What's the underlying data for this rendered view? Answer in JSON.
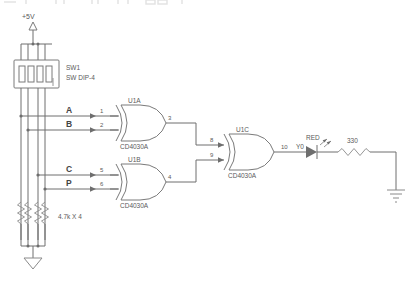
{
  "document": {
    "kind": "circuit-schematic",
    "title": "XOR comparator with DIP switch inputs and RED LED indicator",
    "background_color": "#ffffff",
    "line_color": "#6e6e6e",
    "text_color": "#5a5a5a"
  },
  "toolbar": {
    "visible_fragment": true,
    "note": "faint cropped application toolbar icons along the very top edge"
  },
  "power": {
    "rail_label": "+5V",
    "symbol": "up-arrow"
  },
  "switch": {
    "reference": "SW1",
    "value": "SW DIP-4",
    "poles": 4
  },
  "pulldowns": {
    "value": "4.7k X 4",
    "count": 4,
    "symbol": "zigzag-resistor"
  },
  "signals": [
    {
      "name": "A"
    },
    {
      "name": "B"
    },
    {
      "name": "C"
    },
    {
      "name": "P"
    }
  ],
  "gates": [
    {
      "reference": "U1A",
      "part": "CD4030A",
      "type": "xor",
      "inputs": [
        "1",
        "2"
      ],
      "input_signals": [
        "A",
        "B"
      ],
      "output": "3"
    },
    {
      "reference": "U1B",
      "part": "CD4030A",
      "type": "xor",
      "inputs": [
        "5",
        "6"
      ],
      "input_signals": [
        "C",
        "P"
      ],
      "output": "4"
    },
    {
      "reference": "U1C",
      "part": "CD4030A",
      "type": "xor",
      "inputs": [
        "8",
        "9"
      ],
      "input_signals": [
        "3",
        "4"
      ],
      "output": "10"
    }
  ],
  "output_net": {
    "label": "Y0"
  },
  "led": {
    "label": "RED",
    "symbol": "led-diode"
  },
  "resistor": {
    "value": "330",
    "symbol": "zigzag-resistor"
  },
  "grounds": [
    {
      "style": "triangle",
      "location": "left"
    },
    {
      "style": "earth-bars",
      "location": "right"
    }
  ]
}
